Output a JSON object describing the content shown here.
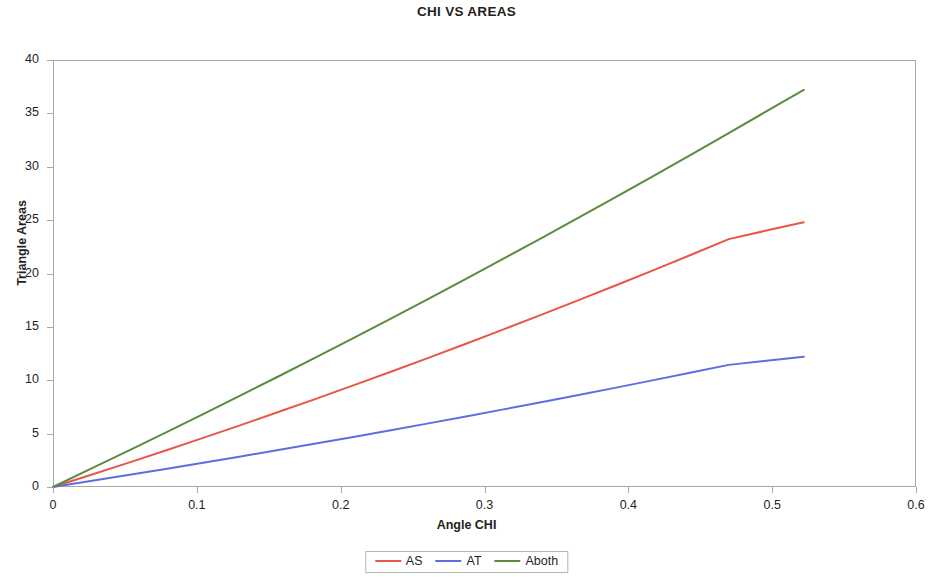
{
  "chart_data": {
    "type": "line",
    "title": "CHI VS AREAS",
    "xlabel": "Angle CHI",
    "ylabel": "Triangle Areas",
    "xlim": [
      0,
      0.6
    ],
    "ylim": [
      0,
      40
    ],
    "xticks": [
      "0",
      "0.1",
      "0.2",
      "0.3",
      "0.4",
      "0.5",
      "0.6"
    ],
    "xtick_values": [
      0,
      0.1,
      0.2,
      0.3,
      0.4,
      0.5,
      0.6
    ],
    "yticks": [
      "0",
      "5",
      "10",
      "15",
      "20",
      "25",
      "30",
      "35",
      "40"
    ],
    "ytick_values": [
      0,
      5,
      10,
      15,
      20,
      25,
      30,
      35,
      40
    ],
    "grid": false,
    "legend_position": "bottom-center",
    "x": [
      0,
      0.0261,
      0.0522,
      0.0783,
      0.1044,
      0.1305,
      0.1566,
      0.1827,
      0.2088,
      0.2349,
      0.261,
      0.2871,
      0.3132,
      0.3393,
      0.3654,
      0.3915,
      0.4176,
      0.4437,
      0.4698,
      0.4959,
      0.522
    ],
    "series": [
      {
        "name": "AS",
        "color": "#E8564A",
        "values": [
          0.0,
          1.12,
          2.26,
          3.42,
          4.6,
          5.8,
          7.02,
          8.26,
          9.52,
          10.8,
          12.1,
          13.42,
          14.76,
          16.12,
          17.5,
          18.9,
          20.32,
          21.76,
          23.22,
          24.02,
          24.8
        ]
      },
      {
        "name": "AT",
        "color": "#5B6FE0",
        "values": [
          0.0,
          0.56,
          1.12,
          1.69,
          2.27,
          2.86,
          3.46,
          4.07,
          4.69,
          5.32,
          5.96,
          6.61,
          7.27,
          7.94,
          8.62,
          9.31,
          10.01,
          10.72,
          11.44,
          11.82,
          12.2
        ]
      },
      {
        "name": "Aboth",
        "color": "#5B8C3E",
        "values": [
          0.0,
          1.69,
          3.39,
          5.1,
          6.83,
          8.58,
          10.35,
          12.14,
          13.95,
          15.78,
          17.63,
          19.5,
          21.39,
          23.3,
          25.23,
          27.18,
          29.15,
          31.14,
          33.15,
          35.18,
          37.2
        ]
      }
    ]
  }
}
